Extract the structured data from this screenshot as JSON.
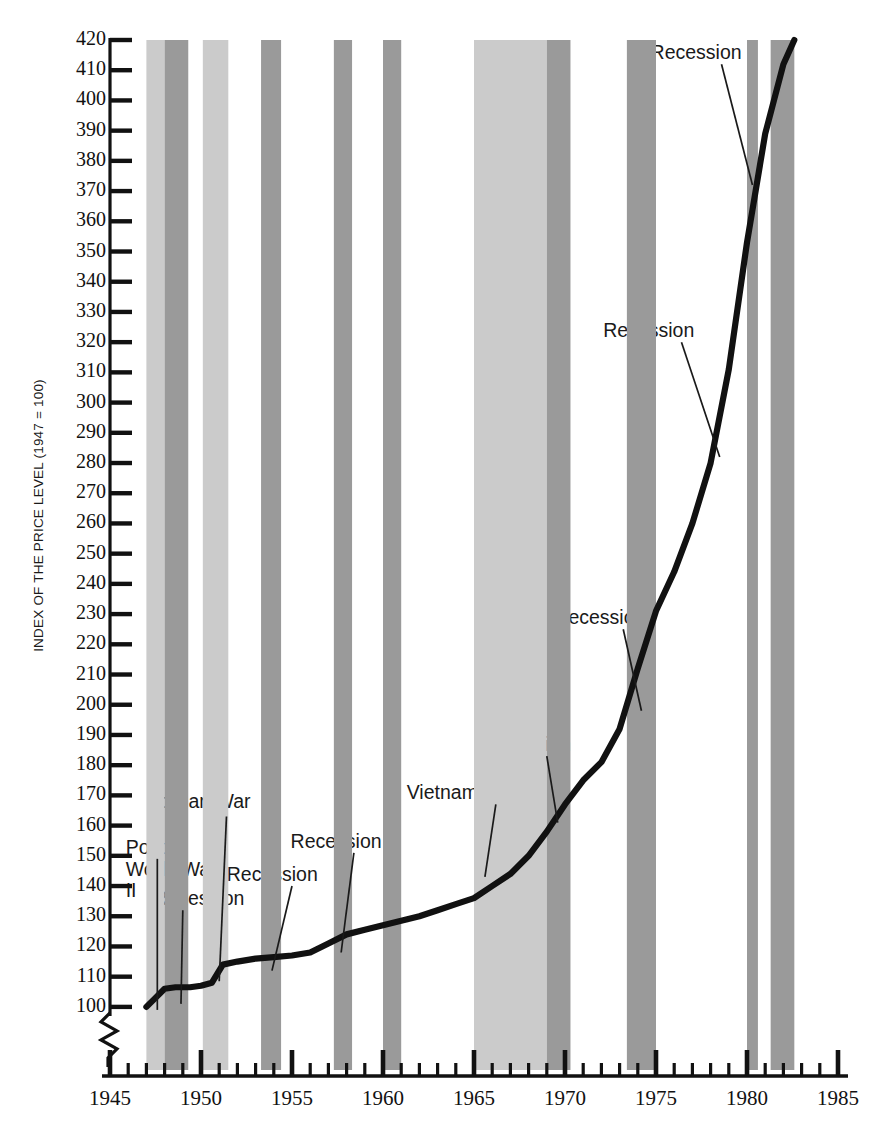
{
  "chart_data": {
    "type": "line",
    "title": "",
    "ylabel": "INDEX OF THE PRICE LEVEL (1947 = 100)",
    "xlabel": "",
    "xlim": [
      1945,
      1985
    ],
    "ylim": [
      95,
      420
    ],
    "y_axis_break": true,
    "grid": false,
    "legend": "none",
    "y_ticks": [
      100,
      110,
      120,
      130,
      140,
      150,
      160,
      170,
      180,
      190,
      200,
      210,
      220,
      230,
      240,
      250,
      260,
      270,
      280,
      290,
      300,
      310,
      320,
      330,
      340,
      350,
      360,
      370,
      380,
      390,
      400,
      410,
      420
    ],
    "x_ticks_major": [
      1945,
      1950,
      1955,
      1960,
      1965,
      1970,
      1975,
      1980,
      1985
    ],
    "x_tick_interval_minor": 1,
    "series": [
      {
        "name": "Price level index",
        "x": [
          1947.0,
          1947.5,
          1948.0,
          1948.6,
          1949.4,
          1950.0,
          1950.6,
          1951.2,
          1952.0,
          1953.0,
          1954.0,
          1955.0,
          1956.0,
          1957.0,
          1958.0,
          1959.0,
          1960.0,
          1961.0,
          1962.0,
          1963.0,
          1964.0,
          1965.0,
          1966.0,
          1967.0,
          1968.0,
          1969.0,
          1970.0,
          1971.0,
          1972.0,
          1973.0,
          1974.0,
          1975.0,
          1976.0,
          1977.0,
          1978.0,
          1979.0,
          1980.0,
          1981.0,
          1982.0,
          1982.6
        ],
        "y": [
          100,
          103,
          106,
          106.5,
          106.5,
          107,
          108,
          114,
          115,
          116,
          116.5,
          117,
          118,
          121,
          124,
          125.5,
          127,
          128.5,
          130,
          132,
          134,
          136,
          140,
          144,
          150,
          158,
          167,
          175,
          181,
          192,
          212,
          231,
          244,
          260,
          280,
          311,
          353,
          389,
          412,
          420
        ]
      }
    ],
    "bands": [
      {
        "label": "Post-World War II",
        "type": "war",
        "x0": 1947.0,
        "x1": 1948.0,
        "shade": "light"
      },
      {
        "label": "Recession",
        "type": "recession",
        "x0": 1948.0,
        "x1": 1949.3,
        "shade": "dark"
      },
      {
        "label": "Korean War",
        "type": "war",
        "x0": 1950.1,
        "x1": 1951.5,
        "shade": "light"
      },
      {
        "label": "Recession",
        "type": "recession",
        "x0": 1953.3,
        "x1": 1954.4,
        "shade": "dark"
      },
      {
        "label": "Recession",
        "type": "recession",
        "x0": 1957.3,
        "x1": 1958.3,
        "shade": "dark"
      },
      {
        "label": "Recession",
        "type": "recession",
        "x0": 1960.0,
        "x1": 1961.0,
        "shade": "dark"
      },
      {
        "label": "Vietnam War",
        "type": "war",
        "x0": 1965.0,
        "x1": 1969.0,
        "shade": "light"
      },
      {
        "label": "Recession",
        "type": "recession",
        "x0": 1969.0,
        "x1": 1970.3,
        "shade": "dark"
      },
      {
        "label": "Recession",
        "type": "recession",
        "x0": 1973.4,
        "x1": 1975.0,
        "shade": "dark"
      },
      {
        "label": "Recession",
        "type": "recession",
        "x0": 1980.0,
        "x1": 1980.6,
        "shade": "dark"
      },
      {
        "label": "Recession",
        "type": "recession",
        "x0": 1981.3,
        "x1": 1982.6,
        "shade": "dark"
      }
    ],
    "annotations": [
      {
        "text": "Post-\nWorld War\nII",
        "x": 1947.4,
        "y": 152
      },
      {
        "text": "Recession",
        "x": 1948.7,
        "y": 135
      },
      {
        "text": "Korean War",
        "x": 1951.0,
        "y": 167
      },
      {
        "text": "Recession",
        "x": 1954.6,
        "y": 143
      },
      {
        "text": "Recession",
        "x": 1958.0,
        "y": 154
      },
      {
        "text": "Vietnam War",
        "x": 1964.6,
        "y": 170
      },
      {
        "text": "Recession",
        "x": 1968.4,
        "y": 186
      },
      {
        "text": "Recession",
        "x": 1972.6,
        "y": 228
      },
      {
        "text": "Recession",
        "x": 1975.4,
        "y": 323
      },
      {
        "text": "Recession",
        "x": 1978.0,
        "y": 415
      }
    ],
    "colors": {
      "line": "#111111",
      "war_band": "#cbcbcb",
      "recession_band": "#9a9a9a",
      "axis": "#111111",
      "text": "#1a1a1a"
    }
  }
}
